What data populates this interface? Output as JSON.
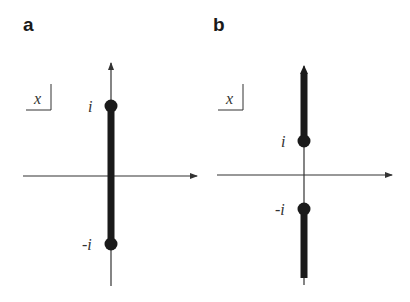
{
  "panels": [
    {
      "label": "a",
      "variable_box": "x",
      "points": [
        {
          "label": "i",
          "value": "i"
        },
        {
          "label": "-i",
          "value": "-i"
        }
      ],
      "cut": "segment between -i and i"
    },
    {
      "label": "b",
      "variable_box": "x",
      "points": [
        {
          "label": "i",
          "value": "i"
        },
        {
          "label": "-i",
          "value": "-i"
        }
      ],
      "cut": "rays from i to +i∞ and from -i to -i∞"
    }
  ],
  "colors": {
    "axis": "#333333",
    "cut": "#1a1a1a",
    "background": "#ffffff"
  }
}
